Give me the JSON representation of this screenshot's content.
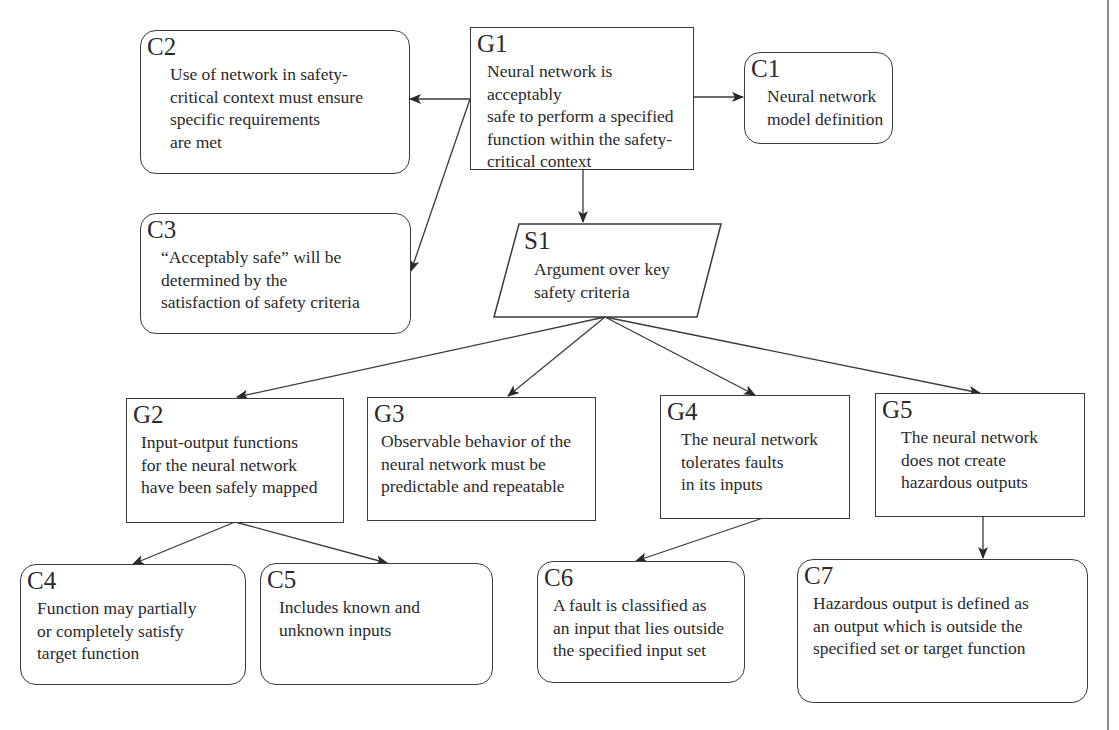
{
  "diagram": {
    "type": "goal-structuring-notation",
    "nodes": {
      "G1": {
        "id": "G1",
        "kind": "goal",
        "text": "Neural network is acceptably\nsafe to perform a specified\nfunction within the safety-\ncritical context"
      },
      "C1": {
        "id": "C1",
        "kind": "context",
        "text": "Neural network\nmodel definition"
      },
      "C2": {
        "id": "C2",
        "kind": "context",
        "text": "Use of network in safety-\ncritical context must ensure\nspecific requirements\nare met"
      },
      "C3": {
        "id": "C3",
        "kind": "context",
        "text": "“Acceptably safe” will be\ndetermined by the\nsatisfaction of safety criteria"
      },
      "S1": {
        "id": "S1",
        "kind": "strategy",
        "text": "Argument over key\nsafety criteria"
      },
      "G2": {
        "id": "G2",
        "kind": "goal",
        "text": "Input-output functions\nfor the neural network\nhave been safely mapped"
      },
      "G3": {
        "id": "G3",
        "kind": "goal",
        "text": "Observable behavior of the\nneural network must be\npredictable and repeatable"
      },
      "G4": {
        "id": "G4",
        "kind": "goal",
        "text": "The neural network\ntolerates faults\nin its inputs"
      },
      "G5": {
        "id": "G5",
        "kind": "goal",
        "text": "The neural network\ndoes not create\nhazardous outputs"
      },
      "C4": {
        "id": "C4",
        "kind": "context",
        "text": "Function may partially\nor completely satisfy\ntarget function"
      },
      "C5": {
        "id": "C5",
        "kind": "context",
        "text": "Includes known and\nunknown inputs"
      },
      "C6": {
        "id": "C6",
        "kind": "context",
        "text": "A fault is classified as\nan input that lies outside\nthe specified input set"
      },
      "C7": {
        "id": "C7",
        "kind": "context",
        "text": "Hazardous output is defined as\nan output which is outside the\nspecified set or target function"
      }
    },
    "edges": [
      {
        "from": "G1",
        "to": "C1"
      },
      {
        "from": "G1",
        "to": "C2"
      },
      {
        "from": "G1",
        "to": "C3"
      },
      {
        "from": "G1",
        "to": "S1"
      },
      {
        "from": "S1",
        "to": "G2"
      },
      {
        "from": "S1",
        "to": "G3"
      },
      {
        "from": "S1",
        "to": "G4"
      },
      {
        "from": "S1",
        "to": "G5"
      },
      {
        "from": "G2",
        "to": "C4"
      },
      {
        "from": "G2",
        "to": "C5"
      },
      {
        "from": "G4",
        "to": "C6"
      },
      {
        "from": "G5",
        "to": "C7"
      }
    ]
  }
}
